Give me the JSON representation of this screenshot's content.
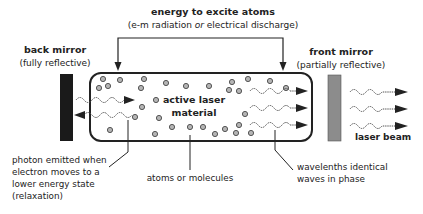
{
  "energy": {
    "title": "energy to excite atoms",
    "subtitle_pre": "(e-m radiation ",
    "subtitle_or": "or",
    "subtitle_post": " electrical discharge)"
  },
  "back_mirror": {
    "title": "back mirror",
    "subtitle": "(fully reflective)",
    "color": "#1a1a1a"
  },
  "front_mirror": {
    "title": "front mirror",
    "subtitle": "(partially reflective)",
    "color": "#8c8c8c"
  },
  "cavity": {
    "label_line1": "active laser",
    "label_line2": "material"
  },
  "laser_beam": {
    "label": "laser beam"
  },
  "callouts": {
    "photon": [
      "photon emitted when",
      "electron moves to a",
      "lower energy state",
      "(relaxation)"
    ],
    "atoms": "atoms or molecules",
    "waves": [
      "wavelenths identical",
      "waves in phase"
    ]
  },
  "colors": {
    "atom_fill": "#b5b5b5",
    "atom_stroke": "#555555",
    "line": "#222222",
    "wave": "#555555"
  }
}
